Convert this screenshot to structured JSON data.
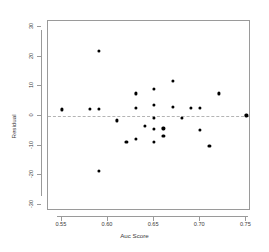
{
  "chart_data": {
    "type": "scatter",
    "title": "",
    "xlabel": "Auc Score",
    "ylabel": "Residual",
    "xlim": [
      0.535,
      0.755
    ],
    "ylim": [
      -32,
      32
    ],
    "xticks": [
      "0.55",
      "0.60",
      "0.65",
      "0.70",
      "0.75"
    ],
    "xtick_values": [
      0.55,
      0.6,
      0.65,
      0.7,
      0.75
    ],
    "yticks": [
      "30",
      "20",
      "10",
      "0",
      "-10",
      "-20",
      "-30"
    ],
    "ytick_values": [
      30,
      20,
      10,
      0,
      -10,
      -20,
      -30
    ],
    "grid": false,
    "legend": null,
    "reference_line": {
      "kind": "horizontal",
      "y": 0,
      "style": "dashed",
      "color": "#b4b4b4"
    },
    "marker": {
      "shape": "circle",
      "color": "#000000",
      "size": 3.2
    },
    "points": [
      {
        "x": 0.55,
        "y": 2.2
      },
      {
        "x": 0.58,
        "y": 2.4
      },
      {
        "x": 0.59,
        "y": 21.8
      },
      {
        "x": 0.59,
        "y": 2.4
      },
      {
        "x": 0.59,
        "y": -18.4
      },
      {
        "x": 0.61,
        "y": -1.5
      },
      {
        "x": 0.62,
        "y": -8.8
      },
      {
        "x": 0.63,
        "y": 7.6
      },
      {
        "x": 0.63,
        "y": 2.6
      },
      {
        "x": 0.63,
        "y": -7.8
      },
      {
        "x": 0.64,
        "y": -3.4
      },
      {
        "x": 0.65,
        "y": 9.0
      },
      {
        "x": 0.65,
        "y": 3.8
      },
      {
        "x": 0.65,
        "y": -0.6
      },
      {
        "x": 0.65,
        "y": -4.4
      },
      {
        "x": 0.65,
        "y": -8.6
      },
      {
        "x": 0.66,
        "y": -4.2
      },
      {
        "x": 0.66,
        "y": -6.8
      },
      {
        "x": 0.67,
        "y": 11.8
      },
      {
        "x": 0.67,
        "y": 3.2
      },
      {
        "x": 0.68,
        "y": -0.6
      },
      {
        "x": 0.69,
        "y": 2.6
      },
      {
        "x": 0.7,
        "y": 2.6
      },
      {
        "x": 0.7,
        "y": -4.6
      },
      {
        "x": 0.71,
        "y": -10.2
      },
      {
        "x": 0.72,
        "y": 7.6
      },
      {
        "x": 0.75,
        "y": 0.2
      }
    ]
  }
}
